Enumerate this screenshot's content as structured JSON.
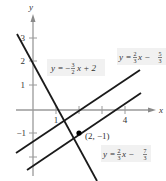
{
  "figure": {
    "type": "coordinate-graph",
    "axes": {
      "x_label": "x",
      "y_label": "y",
      "x_ticks": [
        {
          "value": 1,
          "label": "1"
        },
        {
          "value": 2,
          "label": ""
        },
        {
          "value": 3,
          "label": ""
        },
        {
          "value": 4,
          "label": "4"
        }
      ],
      "y_ticks": [
        {
          "value": 3,
          "label": "3"
        },
        {
          "value": 2,
          "label": "2"
        },
        {
          "value": 1,
          "label": "1"
        },
        {
          "value": -1,
          "label": "−1"
        },
        {
          "value": -2,
          "label": ""
        }
      ]
    },
    "lines": [
      {
        "name": "line-1",
        "equation": "y = −(3/2)x + 2",
        "slope": -1.5,
        "intercept": 2
      },
      {
        "name": "line-2",
        "equation": "y = (2/3)x − 5/3",
        "slope": 0.6667,
        "intercept": -1.6667
      },
      {
        "name": "line-3",
        "equation": "y = (2/3)x − 7/3",
        "slope": 0.6667,
        "intercept": -2.3333
      }
    ],
    "labels": {
      "eq1": {
        "y": "y",
        "eq": "=",
        "sign": "−",
        "num": "3",
        "den": "2",
        "rest": "x + 2"
      },
      "eq2": {
        "y": "y",
        "eq": "=",
        "num1": "2",
        "den1": "3",
        "mid": "x −",
        "num2": "5",
        "den2": "3"
      },
      "eq3": {
        "y": "y",
        "eq": "=",
        "num1": "2",
        "den1": "3",
        "mid": "x −",
        "num2": "7",
        "den2": "3"
      },
      "point": "(2, −1)"
    },
    "point": {
      "x": 2,
      "y": -1
    }
  }
}
